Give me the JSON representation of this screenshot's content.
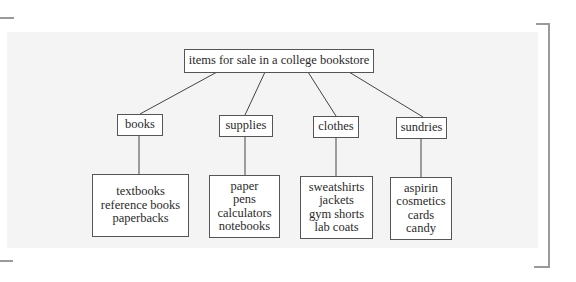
{
  "diagram": {
    "type": "tree",
    "root": {
      "label": "items for sale in a college bookstore"
    },
    "categories": [
      {
        "label": "books",
        "items": [
          "textbooks",
          "reference books",
          "paperbacks"
        ]
      },
      {
        "label": "supplies",
        "items": [
          "paper",
          "pens",
          "calculators",
          "notebooks"
        ]
      },
      {
        "label": "clothes",
        "items": [
          "sweatshirts",
          "jackets",
          "gym shorts",
          "lab coats"
        ]
      },
      {
        "label": "sundries",
        "items": [
          "aspirin",
          "cosmetics",
          "cards",
          "candy"
        ]
      }
    ]
  },
  "colors": {
    "panel_background": "#f4f4f4",
    "box_border": "#555555",
    "line": "#444444",
    "bracket": "#9a9a9a"
  }
}
